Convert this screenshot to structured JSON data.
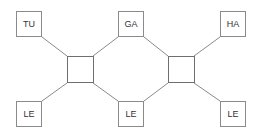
{
  "diagram": {
    "type": "network",
    "line_color": "#8a8a8a",
    "nodes": [
      {
        "id": "tu",
        "label": "TU"
      },
      {
        "id": "ga",
        "label": "GA"
      },
      {
        "id": "ha",
        "label": "HA"
      },
      {
        "id": "le1",
        "label": "LE"
      },
      {
        "id": "le2",
        "label": "LE"
      },
      {
        "id": "le3",
        "label": "LE"
      }
    ],
    "hubs": [
      {
        "id": "hub-left",
        "label": ""
      },
      {
        "id": "hub-right",
        "label": ""
      }
    ],
    "edges": [
      [
        "tu",
        "hub-left"
      ],
      [
        "ga",
        "hub-left"
      ],
      [
        "le1",
        "hub-left"
      ],
      [
        "le2",
        "hub-left"
      ],
      [
        "ga",
        "hub-right"
      ],
      [
        "ha",
        "hub-right"
      ],
      [
        "le2",
        "hub-right"
      ],
      [
        "le3",
        "hub-right"
      ]
    ]
  }
}
